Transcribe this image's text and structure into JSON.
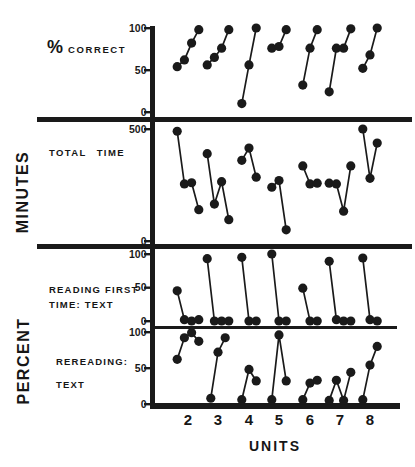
{
  "labels": {
    "panel1_symbol": "%",
    "panel1_title": "CORRECT",
    "panel2_title": "TOTAL TIME",
    "panel3_line1": "READING FIRST",
    "panel3_line2": "TIME: TEXT",
    "panel4_line1": "REREADING:",
    "panel4_line2": "TEXT",
    "minutes": "MINUTES",
    "percent": "PERCENT"
  },
  "colors": {
    "ink": "#1a1a1a",
    "background": "#ffffff"
  },
  "chart_data": {
    "type": "scatter",
    "xlabel": "UNITS",
    "units": [
      2,
      3,
      4,
      5,
      6,
      7,
      8
    ],
    "connected_within_unit": true,
    "point_style": "filled-circle",
    "legend": "none",
    "panels": [
      {
        "title": "% CORRECT",
        "ylabel": "",
        "ylim": [
          0,
          100
        ],
        "yticks": [
          100,
          50,
          0
        ],
        "values_by_unit": [
          [
            54,
            62,
            82,
            98
          ],
          [
            56,
            65,
            76,
            98
          ],
          [
            10,
            56,
            100
          ],
          [
            76,
            78,
            98
          ],
          [
            32,
            76,
            98
          ],
          [
            24,
            76,
            76,
            99
          ],
          [
            52,
            68,
            100
          ]
        ]
      },
      {
        "title": "TOTAL TIME",
        "ylabel": "MINUTES",
        "ylim": [
          0,
          500
        ],
        "yticks": [
          500,
          0
        ],
        "values_by_unit": [
          [
            490,
            255,
            260,
            140
          ],
          [
            390,
            165,
            265,
            95
          ],
          [
            360,
            415,
            285
          ],
          [
            240,
            270,
            50
          ],
          [
            335,
            255,
            258
          ],
          [
            258,
            255,
            133,
            335
          ],
          [
            500,
            280,
            437
          ]
        ]
      },
      {
        "title": "READING FIRST TIME: TEXT",
        "ylabel": "PERCENT",
        "ylim": [
          0,
          100
        ],
        "yticks": [
          100,
          50,
          0
        ],
        "values_by_unit": [
          [
            45,
            2,
            0,
            2
          ],
          [
            93,
            0,
            0,
            0
          ],
          [
            95,
            0,
            0
          ],
          [
            100,
            0,
            0
          ],
          [
            49,
            0,
            0
          ],
          [
            89,
            2,
            0,
            0
          ],
          [
            94,
            2,
            0
          ]
        ]
      },
      {
        "title": "REREADING: TEXT",
        "ylabel": "PERCENT",
        "ylim": [
          0,
          100
        ],
        "yticks": [
          100,
          50,
          0
        ],
        "values_by_unit": [
          [
            62,
            92,
            99,
            87
          ],
          [
            8,
            72,
            92
          ],
          [
            6,
            48,
            32
          ],
          [
            6,
            96,
            32
          ],
          [
            6,
            29,
            33
          ],
          [
            5,
            33,
            5,
            44
          ],
          [
            6,
            54,
            80
          ]
        ]
      }
    ]
  }
}
